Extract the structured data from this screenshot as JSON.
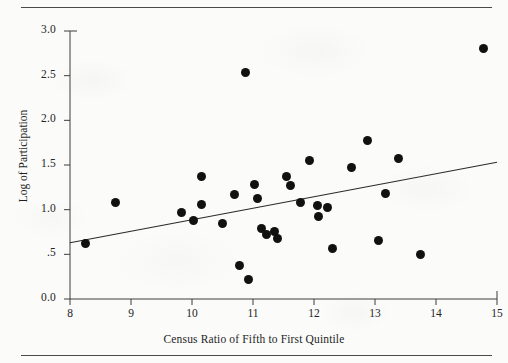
{
  "figure": {
    "cropped_header_text": "",
    "x_axis": {
      "label": "Census Ratio of Fifth to First Quintile",
      "ticks": [
        "8",
        "9",
        "10",
        "11",
        "12",
        "13",
        "14",
        "15"
      ],
      "min": 8,
      "max": 15
    },
    "y_axis": {
      "label": "Log of Participation",
      "ticks": [
        "3.0",
        "2.5",
        "2.0",
        "1.5",
        "1.0",
        ".5",
        "0.0"
      ],
      "min": 0.0,
      "max": 3.0
    },
    "marker_color": "#111111",
    "axis_color": "#3d3d3d",
    "rule_color": "#4a4a4a"
  },
  "chart_data": {
    "type": "scatter",
    "title": "",
    "xlabel": "Census Ratio of Fifth to First Quintile",
    "ylabel": "Log of Participation",
    "xlim": [
      8,
      15
    ],
    "ylim": [
      0.0,
      3.0
    ],
    "xticks": [
      8,
      9,
      10,
      11,
      12,
      13,
      14,
      15
    ],
    "yticks": [
      0.0,
      0.5,
      1.0,
      1.5,
      2.0,
      2.5,
      3.0
    ],
    "ytick_labels": [
      "0.0",
      ".5",
      "1.0",
      "1.5",
      "2.0",
      "2.5",
      "3.0"
    ],
    "grid": false,
    "legend": "none",
    "points": [
      {
        "x": 8.25,
        "y": 0.62
      },
      {
        "x": 8.74,
        "y": 1.08
      },
      {
        "x": 9.83,
        "y": 0.97
      },
      {
        "x": 10.02,
        "y": 0.88
      },
      {
        "x": 10.15,
        "y": 1.37
      },
      {
        "x": 10.15,
        "y": 1.06
      },
      {
        "x": 10.5,
        "y": 0.85
      },
      {
        "x": 10.7,
        "y": 1.17
      },
      {
        "x": 10.78,
        "y": 0.37
      },
      {
        "x": 10.88,
        "y": 2.53
      },
      {
        "x": 10.93,
        "y": 0.22
      },
      {
        "x": 11.02,
        "y": 1.28
      },
      {
        "x": 11.08,
        "y": 1.13
      },
      {
        "x": 11.14,
        "y": 0.79
      },
      {
        "x": 11.22,
        "y": 0.72
      },
      {
        "x": 11.36,
        "y": 0.76
      },
      {
        "x": 11.4,
        "y": 0.68
      },
      {
        "x": 11.55,
        "y": 1.37
      },
      {
        "x": 11.62,
        "y": 1.27
      },
      {
        "x": 11.78,
        "y": 1.08
      },
      {
        "x": 11.92,
        "y": 1.55
      },
      {
        "x": 12.05,
        "y": 1.05
      },
      {
        "x": 12.08,
        "y": 0.92
      },
      {
        "x": 12.22,
        "y": 1.02
      },
      {
        "x": 12.3,
        "y": 0.57
      },
      {
        "x": 12.62,
        "y": 1.47
      },
      {
        "x": 12.88,
        "y": 1.77
      },
      {
        "x": 13.05,
        "y": 0.66
      },
      {
        "x": 13.18,
        "y": 1.18
      },
      {
        "x": 13.38,
        "y": 1.57
      },
      {
        "x": 13.75,
        "y": 0.5
      },
      {
        "x": 14.78,
        "y": 2.8
      }
    ],
    "trendline": {
      "type": "linear",
      "x_start": 8.0,
      "y_start": 0.63,
      "x_end": 15.0,
      "y_end": 1.53,
      "slope": 0.1286,
      "intercept": -0.4
    }
  }
}
